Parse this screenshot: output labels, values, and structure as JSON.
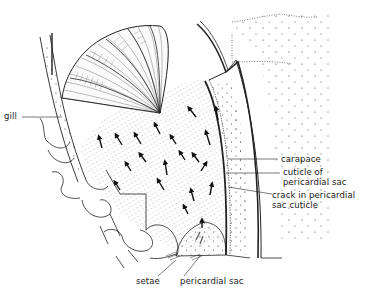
{
  "diagram": {
    "type": "anatomical line drawing",
    "ink_color": "#222222",
    "background": "#ffffff"
  },
  "labels": {
    "gill": "gill",
    "carapace": "carapace",
    "cuticle_line1": "cuticle of",
    "cuticle_line2": "pericardial sac",
    "crack_line1": "crack in pericardial",
    "crack_line2": "sac cuticle",
    "setae": "setae",
    "pericardial_sac": "pericardial sac"
  },
  "arrows": {
    "meaning": "direction of flow",
    "count": 20
  }
}
